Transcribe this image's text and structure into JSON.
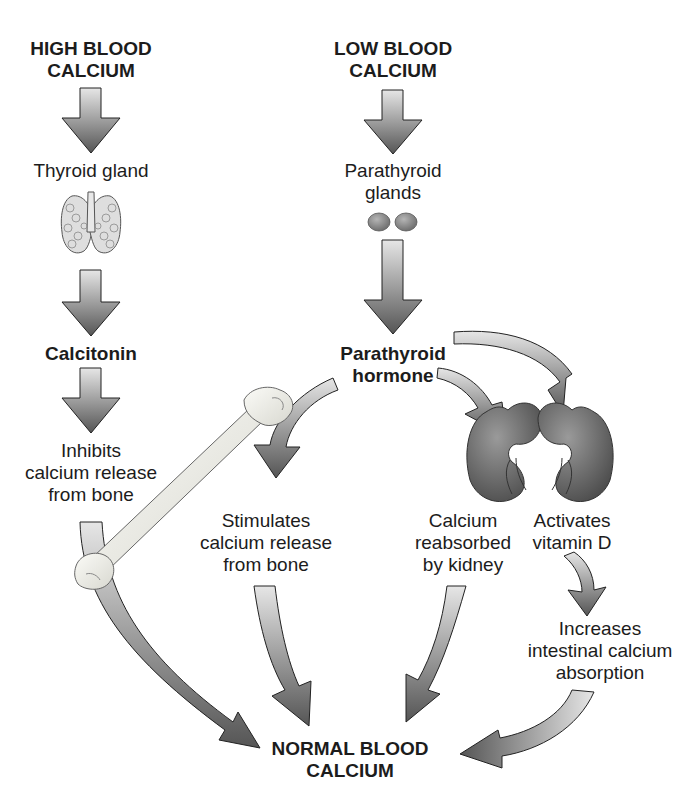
{
  "diagram": {
    "title_top_left": {
      "line1": "HIGH BLOOD",
      "line2": "CALCIUM"
    },
    "title_top_right": {
      "line1": "LOW BLOOD",
      "line2": "CALCIUM"
    },
    "thyroid_label": "Thyroid gland",
    "parathyroid_glands_label": {
      "line1": "Parathyroid",
      "line2": "glands"
    },
    "calcitonin_label": "Calcitonin",
    "pth_label": {
      "line1": "Parathyroid",
      "line2": "hormone"
    },
    "inhibits_label": {
      "line1": "Inhibits",
      "line2": "calcium release",
      "line3": "from bone"
    },
    "stimulates_label": {
      "line1": "Stimulates",
      "line2": "calcium release",
      "line3": "from bone"
    },
    "kidney_reabsorb_label": {
      "line1": "Calcium",
      "line2": "reabsorbed",
      "line3": "by kidney"
    },
    "vitamin_d_label": {
      "line1": "Activates",
      "line2": "vitamin D"
    },
    "intestinal_label": {
      "line1": "Increases",
      "line2": "intestinal calcium",
      "line3": "absorption"
    },
    "result_label": {
      "line1": "NORMAL BLOOD",
      "line2": "CALCIUM"
    },
    "icons": [
      "thyroid-gland-icon",
      "parathyroid-glands-icon",
      "bone-icon",
      "kidney-icon",
      "kidney-icon"
    ],
    "colors": {
      "arrow_dark": "#5a5a5a",
      "arrow_light": "#d8d8d8",
      "organ": "#6e6e6e",
      "bone": "#efefe8"
    }
  }
}
